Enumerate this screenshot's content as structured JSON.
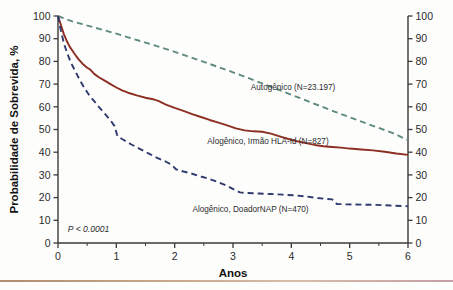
{
  "chart_data": {
    "type": "line",
    "title": "",
    "subtitle": "",
    "xlabel": "Anos",
    "ylabel": "Probabilidade de Sobrevida, %",
    "ylabel_right": "Probabilidade de Sobrevida, %",
    "xlim": [
      0,
      6
    ],
    "ylim": [
      0,
      100
    ],
    "xticks": [
      0,
      1,
      2,
      3,
      4,
      5,
      6
    ],
    "xtick_labels": [
      "0",
      "1",
      "2",
      "3",
      "4",
      "5",
      "6"
    ],
    "xminor_ticks": [
      0.5,
      1.5,
      2.5,
      3.5,
      4.5,
      5.5
    ],
    "yticks": [
      0,
      10,
      20,
      30,
      40,
      50,
      60,
      70,
      80,
      90,
      100
    ],
    "ytick_labels": [
      "0",
      "10",
      "20",
      "30",
      "40",
      "50",
      "60",
      "70",
      "80",
      "90",
      "100"
    ],
    "ytick_labels_right": [
      "0",
      "10",
      "20",
      "30",
      "40",
      "50",
      "60",
      "70",
      "80",
      "90",
      "100"
    ],
    "grid": false,
    "legend_position": "inline-annotations",
    "annotations": [
      {
        "text": "P < 0.0001",
        "x": 0.1,
        "y": 5,
        "style": "italic"
      }
    ],
    "series": [
      {
        "name": "Autogênico (N=23.197)",
        "label": "Autogênico (N=23.197)",
        "color": "#5f8a80",
        "style": "dashed",
        "n": 23197,
        "label_x": 4.03,
        "label_y": 67.5,
        "points": [
          [
            0.0,
            100.0
          ],
          [
            0.08,
            99.2
          ],
          [
            0.17,
            98.3
          ],
          [
            0.25,
            97.6
          ],
          [
            0.4,
            96.5
          ],
          [
            0.6,
            95.1
          ],
          [
            0.8,
            93.7
          ],
          [
            1.0,
            92.2
          ],
          [
            1.25,
            90.2
          ],
          [
            1.5,
            88.3
          ],
          [
            1.75,
            86.3
          ],
          [
            2.0,
            84.2
          ],
          [
            2.25,
            82.0
          ],
          [
            2.5,
            79.8
          ],
          [
            2.75,
            77.5
          ],
          [
            3.0,
            75.2
          ],
          [
            3.25,
            72.8
          ],
          [
            3.5,
            70.3
          ],
          [
            3.75,
            67.8
          ],
          [
            4.0,
            65.3
          ],
          [
            4.25,
            62.8
          ],
          [
            4.5,
            60.3
          ],
          [
            4.75,
            57.8
          ],
          [
            5.0,
            55.4
          ],
          [
            5.25,
            53.0
          ],
          [
            5.5,
            50.7
          ],
          [
            5.75,
            48.3
          ],
          [
            6.0,
            45.3
          ]
        ]
      },
      {
        "name": "Alogênico, Irmão HLA-Id (N=827)",
        "label": "Alogênico, Irmão HLA-Id (N=827)",
        "color": "#8c2e22",
        "style": "solid",
        "n": 827,
        "label_x": 3.6,
        "label_y": 43.5,
        "points": [
          [
            0.0,
            100.0
          ],
          [
            0.05,
            96.0
          ],
          [
            0.1,
            92.0
          ],
          [
            0.15,
            89.0
          ],
          [
            0.2,
            86.5
          ],
          [
            0.28,
            83.5
          ],
          [
            0.35,
            81.0
          ],
          [
            0.42,
            79.0
          ],
          [
            0.5,
            77.2
          ],
          [
            0.55,
            76.5
          ],
          [
            0.62,
            74.5
          ],
          [
            0.7,
            73.0
          ],
          [
            0.8,
            71.5
          ],
          [
            0.9,
            70.0
          ],
          [
            1.0,
            68.5
          ],
          [
            1.1,
            67.2
          ],
          [
            1.2,
            66.2
          ],
          [
            1.35,
            65.0
          ],
          [
            1.5,
            64.0
          ],
          [
            1.65,
            63.2
          ],
          [
            1.72,
            62.6
          ],
          [
            1.85,
            61.0
          ],
          [
            2.0,
            59.5
          ],
          [
            2.15,
            58.2
          ],
          [
            2.3,
            56.8
          ],
          [
            2.45,
            55.5
          ],
          [
            2.6,
            54.2
          ],
          [
            2.75,
            53.0
          ],
          [
            2.9,
            51.8
          ],
          [
            3.05,
            50.5
          ],
          [
            3.2,
            49.6
          ],
          [
            3.35,
            49.2
          ],
          [
            3.5,
            49.0
          ],
          [
            3.65,
            48.2
          ],
          [
            3.8,
            47.0
          ],
          [
            3.95,
            45.8
          ],
          [
            4.1,
            44.8
          ],
          [
            4.25,
            44.0
          ],
          [
            4.4,
            43.2
          ],
          [
            4.55,
            42.6
          ],
          [
            4.7,
            42.3
          ],
          [
            4.85,
            42.0
          ],
          [
            5.0,
            41.6
          ],
          [
            5.2,
            41.2
          ],
          [
            5.4,
            40.8
          ],
          [
            5.6,
            40.2
          ],
          [
            5.8,
            39.4
          ],
          [
            6.0,
            38.8
          ]
        ]
      },
      {
        "name": "Alogênico, DoadorNAP (N=470)",
        "label": "Alogênico, DoadorNAP (N=470)",
        "color": "#2f3a6e",
        "style": "dashed",
        "n": 470,
        "label_x": 3.3,
        "label_y": 13.5,
        "points": [
          [
            0.0,
            100.0
          ],
          [
            0.05,
            93.5
          ],
          [
            0.1,
            88.0
          ],
          [
            0.16,
            83.5
          ],
          [
            0.22,
            79.5
          ],
          [
            0.3,
            75.5
          ],
          [
            0.38,
            71.5
          ],
          [
            0.46,
            68.0
          ],
          [
            0.55,
            64.5
          ],
          [
            0.62,
            62.5
          ],
          [
            0.7,
            60.0
          ],
          [
            0.8,
            57.0
          ],
          [
            0.9,
            54.0
          ],
          [
            0.97,
            51.5
          ],
          [
            1.02,
            47.0
          ],
          [
            1.12,
            45.5
          ],
          [
            1.25,
            43.5
          ],
          [
            1.4,
            41.5
          ],
          [
            1.55,
            39.5
          ],
          [
            1.7,
            37.5
          ],
          [
            1.85,
            35.8
          ],
          [
            1.95,
            34.5
          ],
          [
            2.02,
            32.5
          ],
          [
            2.15,
            31.5
          ],
          [
            2.3,
            30.5
          ],
          [
            2.45,
            29.3
          ],
          [
            2.6,
            28.2
          ],
          [
            2.75,
            26.8
          ],
          [
            2.9,
            25.2
          ],
          [
            3.02,
            23.5
          ],
          [
            3.12,
            22.3
          ],
          [
            3.25,
            22.0
          ],
          [
            3.45,
            21.8
          ],
          [
            3.65,
            21.6
          ],
          [
            3.85,
            21.3
          ],
          [
            4.05,
            21.0
          ],
          [
            4.25,
            20.5
          ],
          [
            4.45,
            19.8
          ],
          [
            4.6,
            19.4
          ],
          [
            4.7,
            19.2
          ],
          [
            4.78,
            17.2
          ],
          [
            4.95,
            17.0
          ],
          [
            5.2,
            16.9
          ],
          [
            5.45,
            16.8
          ],
          [
            5.7,
            16.5
          ],
          [
            6.0,
            16.2
          ]
        ]
      }
    ]
  },
  "figure": {
    "background_color": "#fdfdfc",
    "axis_color": "#3a3a3a",
    "footer_rule_color": "#b08d72"
  }
}
